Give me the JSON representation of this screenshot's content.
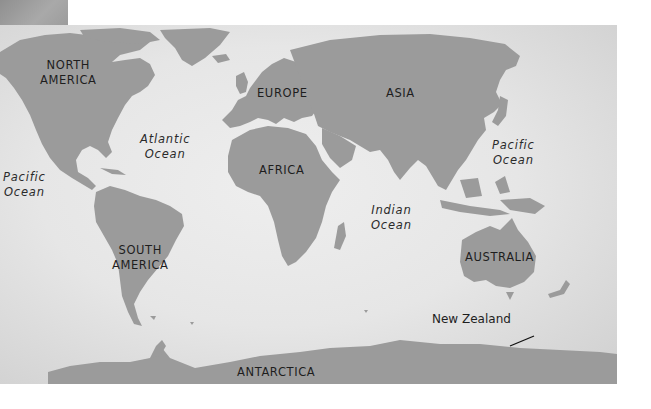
{
  "map": {
    "title": "World map with continents and oceans",
    "colors": {
      "land": "#9b9b9b",
      "ocean": "#e8e8e8",
      "text": "#1e1e1e",
      "corner_patch": "#9c9c9c"
    },
    "continents": [
      {
        "id": "north-america",
        "lines": [
          "NORTH",
          "AMERICA"
        ]
      },
      {
        "id": "south-america",
        "lines": [
          "SOUTH",
          "AMERICA"
        ]
      },
      {
        "id": "europe",
        "lines": [
          "EUROPE"
        ]
      },
      {
        "id": "asia",
        "lines": [
          "ASIA"
        ]
      },
      {
        "id": "africa",
        "lines": [
          "AFRICA"
        ]
      },
      {
        "id": "australia",
        "lines": [
          "AUSTRALIA"
        ]
      },
      {
        "id": "antarctica",
        "lines": [
          "ANTARCTICA"
        ]
      }
    ],
    "oceans": [
      {
        "id": "atlantic",
        "lines": [
          "Atlantic",
          "Ocean"
        ]
      },
      {
        "id": "pacific-east",
        "lines": [
          "Pacific",
          "Ocean"
        ]
      },
      {
        "id": "pacific-west",
        "lines": [
          "Pacific",
          "Ocean"
        ]
      },
      {
        "id": "indian",
        "lines": [
          "Indian",
          "Ocean"
        ]
      }
    ],
    "callouts": [
      {
        "id": "new-zealand",
        "label": "New Zealand"
      }
    ]
  }
}
